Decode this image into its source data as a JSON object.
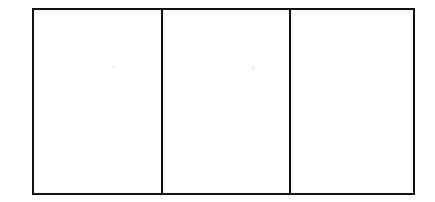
{
  "figure": {
    "background_color": "#ffffff",
    "stroke_color": "#111111",
    "fill_color": "#ffffff",
    "stroke_width_px": 2,
    "canvas": {
      "width_px": 435,
      "height_px": 202
    },
    "outer_rectangle": {
      "name": "outer-rectangle",
      "left_px": 32,
      "top_px": 8,
      "width_px": 383,
      "height_px": 187
    },
    "dividers": [
      {
        "name": "divider-1",
        "x_px": 161,
        "orientation": "vertical"
      },
      {
        "name": "divider-2",
        "x_px": 289,
        "orientation": "vertical"
      }
    ],
    "panels": [
      {
        "name": "panel-left",
        "label": "",
        "left_px": 34,
        "width_px": 127,
        "content": ""
      },
      {
        "name": "panel-center",
        "label": "",
        "left_px": 163,
        "width_px": 126,
        "content": ""
      },
      {
        "name": "panel-right",
        "label": "",
        "left_px": 291,
        "width_px": 122,
        "content": ""
      }
    ],
    "artifacts": [
      {
        "name": "speckle-1",
        "x_px": 111,
        "y_px": 65,
        "color": "#f2f2f2"
      },
      {
        "name": "speckle-2",
        "x_px": 251,
        "y_px": 66,
        "color": "#f2f2f2"
      }
    ]
  }
}
